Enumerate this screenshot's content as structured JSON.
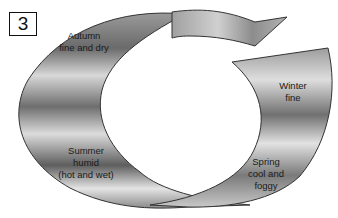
{
  "figure": {
    "number": "3",
    "type": "seasonal cycle diagram",
    "seasons": [
      {
        "name": "Autumn",
        "line1": "Autumn",
        "line2": "fine and dry",
        "line3": ""
      },
      {
        "name": "Winter",
        "line1": "Winter",
        "line2": "fine",
        "line3": ""
      },
      {
        "name": "Spring",
        "line1": "Spring",
        "line2": "cool and",
        "line3": "foggy"
      },
      {
        "name": "Summer",
        "line1": "Summer",
        "line2": "humid",
        "line3": "(hot and wet)"
      }
    ],
    "colors": {
      "band_dark": "#5a5a5a",
      "band_light": "#e6e6e6",
      "outline": "#333333",
      "background": "#ffffff"
    }
  }
}
